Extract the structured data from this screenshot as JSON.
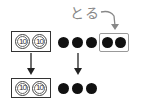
{
  "diagram": {
    "take_label": "とる",
    "top_row": {
      "tens": [
        "10",
        "10"
      ],
      "ones_count": 5,
      "taken_count": 2
    },
    "bottom_row": {
      "tens": [
        "10",
        "10"
      ],
      "ones_count": 3
    },
    "colors": {
      "dot": "#111111",
      "box_border": "#333333",
      "take_box_border": "#999999",
      "take_label": "#888888",
      "arrow": "#222222"
    }
  }
}
